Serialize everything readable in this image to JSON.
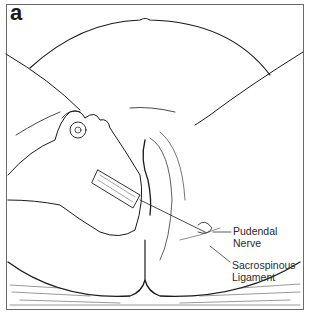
{
  "figure": {
    "panel_label": "a",
    "style": "black line art on white"
  },
  "callouts": [
    {
      "id": "pudendal-nerve",
      "line1": "Pudendal",
      "line2": "Nerve"
    },
    {
      "id": "sacrospinous-ligament",
      "line1": "Sacrospinous",
      "line2": "Ligament"
    }
  ],
  "colors": {
    "ink": "#1a1a1a",
    "border": "#6b6b6b",
    "background": "#ffffff"
  }
}
